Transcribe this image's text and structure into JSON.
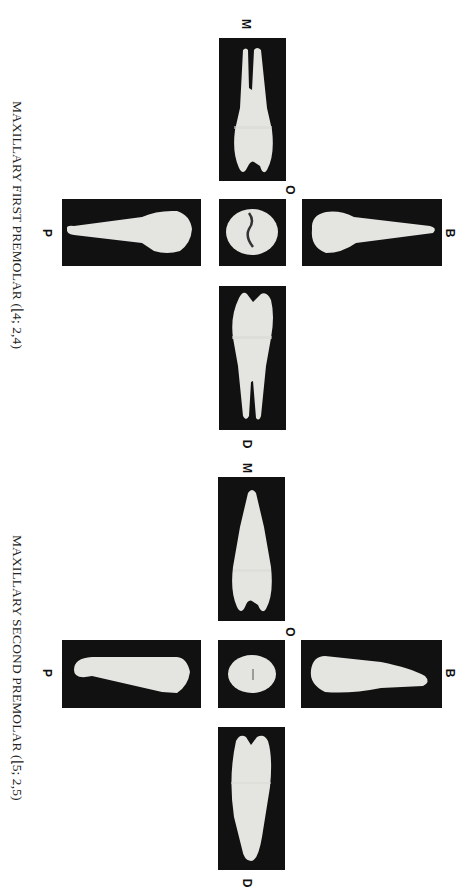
{
  "figures": [
    {
      "caption": "MAXILLARY FIRST PREMOLAR (⌊4; 2,4)",
      "caption_parts": {
        "name": "MAXILLARY FIRST PREMOLAR (",
        "notation": "⌊4; 2,4)"
      },
      "labels": {
        "mesial": "M",
        "occlusal": "O",
        "buccal": "B",
        "palatal": "P",
        "distal": "D"
      },
      "views": [
        "mesial-view",
        "palatal-view",
        "occlusal-view",
        "buccal-view",
        "distal-view"
      ]
    },
    {
      "caption": "MAXILLARY SECOND PREMOLAR (⌊5; 2,5)",
      "caption_parts": {
        "name": "MAXILLARY SECOND PREMOLAR (",
        "notation": "⌊5; 2,5)"
      },
      "labels": {
        "mesial": "M",
        "occlusal": "O",
        "buccal": "B",
        "palatal": "P",
        "distal": "D"
      },
      "views": [
        "mesial-view",
        "palatal-view",
        "occlusal-view",
        "buccal-view",
        "distal-view"
      ]
    }
  ],
  "colors": {
    "panel_bg": "#111111",
    "tooth": "#e4e4e0",
    "text": "#222222",
    "page_bg": "#ffffff"
  }
}
